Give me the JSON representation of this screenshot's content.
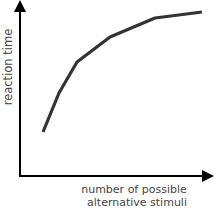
{
  "chart_data": {
    "type": "line",
    "title": "",
    "xlabel": "number of possible alternative stimuli",
    "xlabel_lines": [
      "number of possible",
      "alternative stimuli"
    ],
    "ylabel": "reaction time",
    "grid": false,
    "legend": null,
    "ticks": "none",
    "series": [
      {
        "name": "reaction time curve",
        "color": "#333333",
        "points_px": [
          [
            43,
            132
          ],
          [
            59,
            93
          ],
          [
            77,
            62
          ],
          [
            110,
            37
          ],
          [
            155,
            18
          ],
          [
            202,
            12
          ]
        ],
        "x": [
          1,
          2,
          3,
          4,
          5,
          6
        ],
        "values": [
          0.35,
          0.55,
          0.7,
          0.82,
          0.92,
          0.95
        ]
      }
    ]
  },
  "colors": {
    "axis": "#000000",
    "curve": "#333333",
    "label": "#444444"
  }
}
